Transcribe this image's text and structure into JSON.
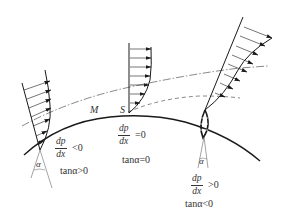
{
  "diagram": {
    "type": "boundary-layer-separation",
    "labels": {
      "point_M": "M",
      "point_S": "S",
      "alpha": "α"
    },
    "profiles": [
      {
        "position": "left",
        "gradient_num": "dp",
        "gradient_den": "dx",
        "gradient_rel": "<0",
        "tan_label": "tanα>0"
      },
      {
        "position": "middle",
        "gradient_num": "dp",
        "gradient_den": "dx",
        "gradient_rel": "=0",
        "tan_label": "tanα=0"
      },
      {
        "position": "right",
        "gradient_num": "dp",
        "gradient_den": "dx",
        "gradient_rel": ">0",
        "tan_label": "tanα<0"
      }
    ],
    "lines": {
      "surface": "solid curve",
      "boundary_layer_edge": "dash-dot curve",
      "separation_streamline": "dashed curve"
    },
    "colors": {
      "stroke": "#1a1a1a",
      "text": "#333333",
      "background": "#ffffff"
    }
  }
}
